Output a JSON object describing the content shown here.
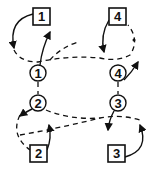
{
  "diagram": {
    "circles": [
      {
        "id": "c1",
        "label": "1",
        "cx": 38,
        "cy": 73
      },
      {
        "id": "c2",
        "label": "2",
        "cx": 38,
        "cy": 103
      },
      {
        "id": "c3",
        "label": "3",
        "cx": 118,
        "cy": 103
      },
      {
        "id": "c4",
        "label": "4",
        "cx": 118,
        "cy": 73
      }
    ],
    "squares": [
      {
        "id": "s1",
        "label": "1",
        "x": 33,
        "y": 8
      },
      {
        "id": "s2",
        "label": "2",
        "x": 30,
        "y": 145
      },
      {
        "id": "s3",
        "label": "3",
        "x": 108,
        "y": 145
      },
      {
        "id": "s4",
        "label": "4",
        "x": 109,
        "y": 8
      }
    ],
    "stroke_color": "#111111"
  }
}
